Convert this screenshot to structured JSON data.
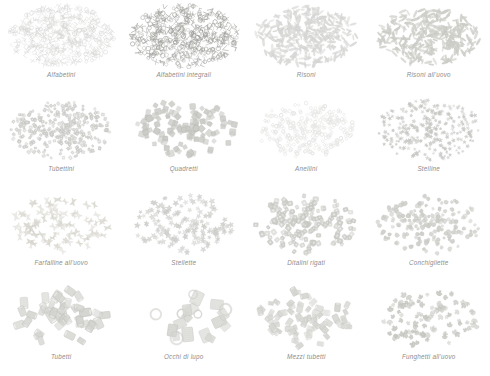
{
  "page": {
    "background_color": "#ffffff",
    "caption_color": "#8d8d8d",
    "columns": 4,
    "rows": 4
  },
  "panels": [
    {
      "label": "Alfabetini",
      "shape": "letters",
      "count": 420,
      "color": "#d8d8d6",
      "stroke": "#c2c2c0",
      "size": 2.1,
      "spread": 0.94,
      "seed": 11
    },
    {
      "label": "Alfabetini integrali",
      "shape": "letters",
      "count": 430,
      "color": "#9d9d99",
      "stroke": "#868682",
      "size": 2.2,
      "spread": 0.96,
      "seed": 23
    },
    {
      "label": "Risoni",
      "shape": "grain",
      "count": 330,
      "color": "#dcdcda",
      "stroke": "#c6c6c4",
      "size": 3.4,
      "spread": 0.92,
      "seed": 37
    },
    {
      "label": "Risoni all'uovo",
      "shape": "grain",
      "count": 300,
      "color": "#d2d2cd",
      "stroke": "#bdbdb8",
      "size": 3.6,
      "spread": 0.9,
      "seed": 53
    },
    {
      "label": "Tubettini",
      "shape": "tubelet",
      "count": 330,
      "color": "#cfcfcc",
      "stroke": "#bcbcb9",
      "size": 2.6,
      "spread": 0.9,
      "seed": 71
    },
    {
      "label": "Quadretti",
      "shape": "square",
      "count": 115,
      "color": "#cbcbc7",
      "stroke": "#b4b4b0",
      "size": 5.0,
      "spread": 0.92,
      "seed": 89
    },
    {
      "label": "Anellini",
      "shape": "ring",
      "count": 300,
      "color": "#e6e6e4",
      "stroke": "#d5d5d3",
      "size": 2.6,
      "spread": 0.86,
      "seed": 103
    },
    {
      "label": "Stelline",
      "shape": "star",
      "count": 290,
      "color": "#cdcdca",
      "stroke": "#b6b6b3",
      "size": 3.1,
      "spread": 0.94,
      "seed": 127
    },
    {
      "label": "Farfalline all'uovo",
      "shape": "bowtie",
      "count": 85,
      "color": "#dedcd4",
      "stroke": "#c9c7bf",
      "size": 6.4,
      "spread": 0.9,
      "seed": 149
    },
    {
      "label": "Stellette",
      "shape": "star",
      "count": 150,
      "color": "#d4d4d1",
      "stroke": "#bebebb",
      "size": 4.4,
      "spread": 0.9,
      "seed": 167
    },
    {
      "label": "Ditalini rigati",
      "shape": "tubelet",
      "count": 170,
      "color": "#cfcfcb",
      "stroke": "#b8b8b4",
      "size": 4.0,
      "spread": 0.9,
      "seed": 191
    },
    {
      "label": "Conchigliette",
      "shape": "shell",
      "count": 190,
      "color": "#d0d0cc",
      "stroke": "#b9b9b5",
      "size": 3.9,
      "spread": 0.92,
      "seed": 211
    },
    {
      "label": "Tubetti",
      "shape": "tube",
      "count": 42,
      "color": "#d3d3cf",
      "stroke": "#bbbbb7",
      "size": 9.5,
      "spread": 0.86,
      "seed": 233
    },
    {
      "label": "Occhi di lupo",
      "shape": "bigtube",
      "count": 20,
      "color": "#dadad6",
      "stroke": "#c0c0bc",
      "size": 15.0,
      "spread": 0.8,
      "seed": 251
    },
    {
      "label": "Mezzi tubetti",
      "shape": "tube",
      "count": 70,
      "color": "#d6d6d2",
      "stroke": "#bebeba",
      "size": 7.0,
      "spread": 0.88,
      "seed": 277
    },
    {
      "label": "Funghetti all'uovo",
      "shape": "mushroom",
      "count": 95,
      "color": "#cdcdc8",
      "stroke": "#b5b5b0",
      "size": 5.6,
      "spread": 0.9,
      "seed": 293
    }
  ]
}
